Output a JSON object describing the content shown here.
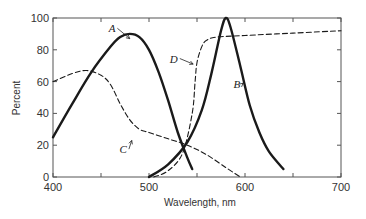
{
  "chart_data": {
    "type": "line",
    "title": "",
    "xlabel": "Wavelength,  nm",
    "ylabel": "Percent",
    "xlim": [
      400,
      700
    ],
    "ylim": [
      0,
      100
    ],
    "xticks": [
      400,
      450,
      500,
      550,
      600,
      650,
      700
    ],
    "xtick_labels": [
      "400",
      "500",
      "600",
      "700"
    ],
    "xtick_label_values": [
      400,
      500,
      600,
      700
    ],
    "yticks": [
      0,
      20,
      40,
      60,
      80,
      100
    ],
    "ytick_labels": [
      "0",
      "20",
      "40",
      "60",
      "80",
      "100"
    ],
    "grid": false,
    "legend": "inline labels with arrows",
    "series": [
      {
        "name": "A",
        "style": "solid",
        "x": [
          400,
          420,
          440,
          460,
          470,
          480,
          490,
          500,
          510,
          520,
          530,
          540,
          545
        ],
        "y": [
          25,
          46,
          66,
          82,
          88,
          90,
          88,
          80,
          66,
          48,
          28,
          12,
          5
        ]
      },
      {
        "name": "B",
        "style": "solid",
        "x": [
          500,
          520,
          540,
          555,
          565,
          575,
          580,
          585,
          595,
          605,
          615,
          625,
          640
        ],
        "y": [
          0,
          8,
          22,
          42,
          65,
          92,
          100,
          94,
          70,
          45,
          28,
          16,
          5
        ]
      },
      {
        "name": "C",
        "style": "dashed",
        "x": [
          400,
          420,
          435,
          450,
          460,
          470,
          480,
          490,
          500,
          520,
          540,
          560,
          580,
          595
        ],
        "y": [
          60,
          65,
          67,
          64,
          58,
          46,
          36,
          30,
          28,
          24,
          20,
          14,
          6,
          0
        ]
      },
      {
        "name": "D",
        "style": "dashed",
        "x": [
          505,
          520,
          535,
          545,
          548,
          550,
          555,
          560,
          570,
          600,
          650,
          700
        ],
        "y": [
          0,
          4,
          15,
          40,
          60,
          72,
          82,
          86,
          88,
          89,
          90.5,
          92
        ]
      }
    ],
    "annotations": [
      {
        "text": "A",
        "x": 465,
        "y": 91,
        "points_to": [
          480,
          87
        ]
      },
      {
        "text": "B",
        "x": 595,
        "y": 56,
        "points_to": [
          598,
          59
        ]
      },
      {
        "text": "C",
        "x": 477,
        "y": 15,
        "points_to": [
          482,
          23
        ]
      },
      {
        "text": "D",
        "x": 530,
        "y": 72,
        "points_to": [
          546,
          71
        ]
      }
    ]
  }
}
